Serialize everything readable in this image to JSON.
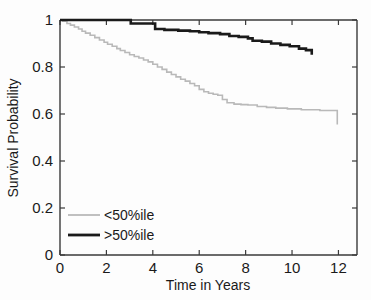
{
  "chart_data": {
    "type": "line",
    "title": "",
    "subtitle": "",
    "xlabel": "Time in Years",
    "ylabel": "Survival Probability",
    "xlim": [
      0,
      12.8
    ],
    "ylim": [
      0,
      1
    ],
    "xticks": [
      0,
      2,
      4,
      6,
      8,
      10,
      12
    ],
    "xtick_labels": [
      "0",
      "2",
      "4",
      "6",
      "8",
      "10",
      "12"
    ],
    "yticks": [
      0,
      0.2,
      0.4,
      0.6,
      0.8,
      1
    ],
    "ytick_labels": [
      "0",
      "0.2",
      "0.4",
      "0.6",
      "0.8",
      "1"
    ],
    "grid": false,
    "legend_position": "lower-left",
    "step_type": "post",
    "series": [
      {
        "name": "<50%ile",
        "color": "#b9b9b9",
        "linewidth": 1.6,
        "x": [
          0,
          0.12,
          0.3,
          0.45,
          0.62,
          0.8,
          0.95,
          1.1,
          1.3,
          1.5,
          1.7,
          1.9,
          2.05,
          2.25,
          2.45,
          2.6,
          2.8,
          3.0,
          3.2,
          3.4,
          3.6,
          3.8,
          4.0,
          4.2,
          4.4,
          4.6,
          4.8,
          5.0,
          5.2,
          5.4,
          5.6,
          5.8,
          6.0,
          6.2,
          6.4,
          6.6,
          6.8,
          7.0,
          7.2,
          7.5,
          7.8,
          8.1,
          8.5,
          8.9,
          9.3,
          9.8,
          10.4,
          11.2,
          11.95,
          11.95
        ],
        "y": [
          1.0,
          0.995,
          0.985,
          0.978,
          0.97,
          0.962,
          0.952,
          0.944,
          0.935,
          0.925,
          0.915,
          0.905,
          0.897,
          0.888,
          0.878,
          0.87,
          0.862,
          0.852,
          0.845,
          0.838,
          0.83,
          0.822,
          0.812,
          0.8,
          0.79,
          0.778,
          0.768,
          0.758,
          0.748,
          0.74,
          0.73,
          0.72,
          0.705,
          0.695,
          0.688,
          0.684,
          0.68,
          0.662,
          0.648,
          0.642,
          0.64,
          0.638,
          0.632,
          0.628,
          0.625,
          0.622,
          0.618,
          0.615,
          0.615,
          0.555
        ]
      },
      {
        "name": ">50%ile",
        "color": "#1a1a1a",
        "linewidth": 2.6,
        "x": [
          0,
          1.35,
          2.9,
          3.05,
          3.95,
          4.1,
          4.5,
          5.1,
          5.6,
          6.0,
          6.4,
          6.9,
          7.3,
          7.7,
          8.1,
          8.3,
          8.7,
          9.1,
          9.5,
          9.9,
          10.3,
          10.6,
          10.85,
          10.85
        ],
        "y": [
          1.0,
          1.0,
          1.0,
          0.985,
          0.985,
          0.962,
          0.958,
          0.955,
          0.952,
          0.948,
          0.944,
          0.94,
          0.932,
          0.928,
          0.922,
          0.912,
          0.908,
          0.9,
          0.894,
          0.888,
          0.878,
          0.872,
          0.872,
          0.852
        ]
      }
    ]
  },
  "legend": {
    "entries": [
      {
        "label": "<50%ile",
        "color": "#b9b9b9"
      },
      {
        "label": ">50%ile",
        "color": "#1a1a1a"
      }
    ]
  },
  "axes": {
    "x_title": "Time in Years",
    "y_title": "Survival Probability",
    "x_tick_labels": [
      "0",
      "2",
      "4",
      "6",
      "8",
      "10",
      "12"
    ],
    "y_tick_labels": [
      "0",
      "0.2",
      "0.4",
      "0.6",
      "0.8",
      "1"
    ]
  }
}
